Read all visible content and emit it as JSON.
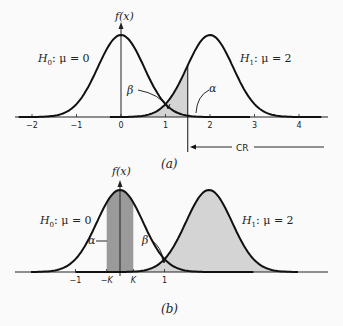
{
  "figure": {
    "panel_a": {
      "caption": "(a)",
      "yaxis_label": "f(x)",
      "h0_label": "H",
      "h0_sub": "0",
      "h0_rest": ": μ = 0",
      "h1_label": "H",
      "h1_sub": "1",
      "h1_rest": ": μ = 2",
      "beta_label": "β",
      "alpha_label": "α",
      "cr_label": "CR",
      "critical_value": 1.5,
      "ticks": [
        "−2",
        "−1",
        "0",
        "1",
        "2",
        "3",
        "4"
      ],
      "tick_values": [
        -2,
        -1,
        0,
        1,
        2,
        3,
        4
      ]
    },
    "panel_b": {
      "caption": "(b)",
      "yaxis_label": "f(x)",
      "h0_label": "H",
      "h0_sub": "0",
      "h0_rest": ": μ = 0",
      "h1_label": "H",
      "h1_sub": "1",
      "h1_rest": ": μ = 2",
      "beta_label": "β",
      "alpha_label": "α",
      "ticks": [
        "−1",
        "−K",
        "K",
        "1"
      ],
      "tick_values": [
        -1,
        -0.3,
        0.3,
        1
      ],
      "K": 0.3
    },
    "colors": {
      "curve": "#111111",
      "light_fill": "#d4d4d4",
      "dark_fill": "#9a9a9a",
      "axis": "#222222"
    }
  }
}
